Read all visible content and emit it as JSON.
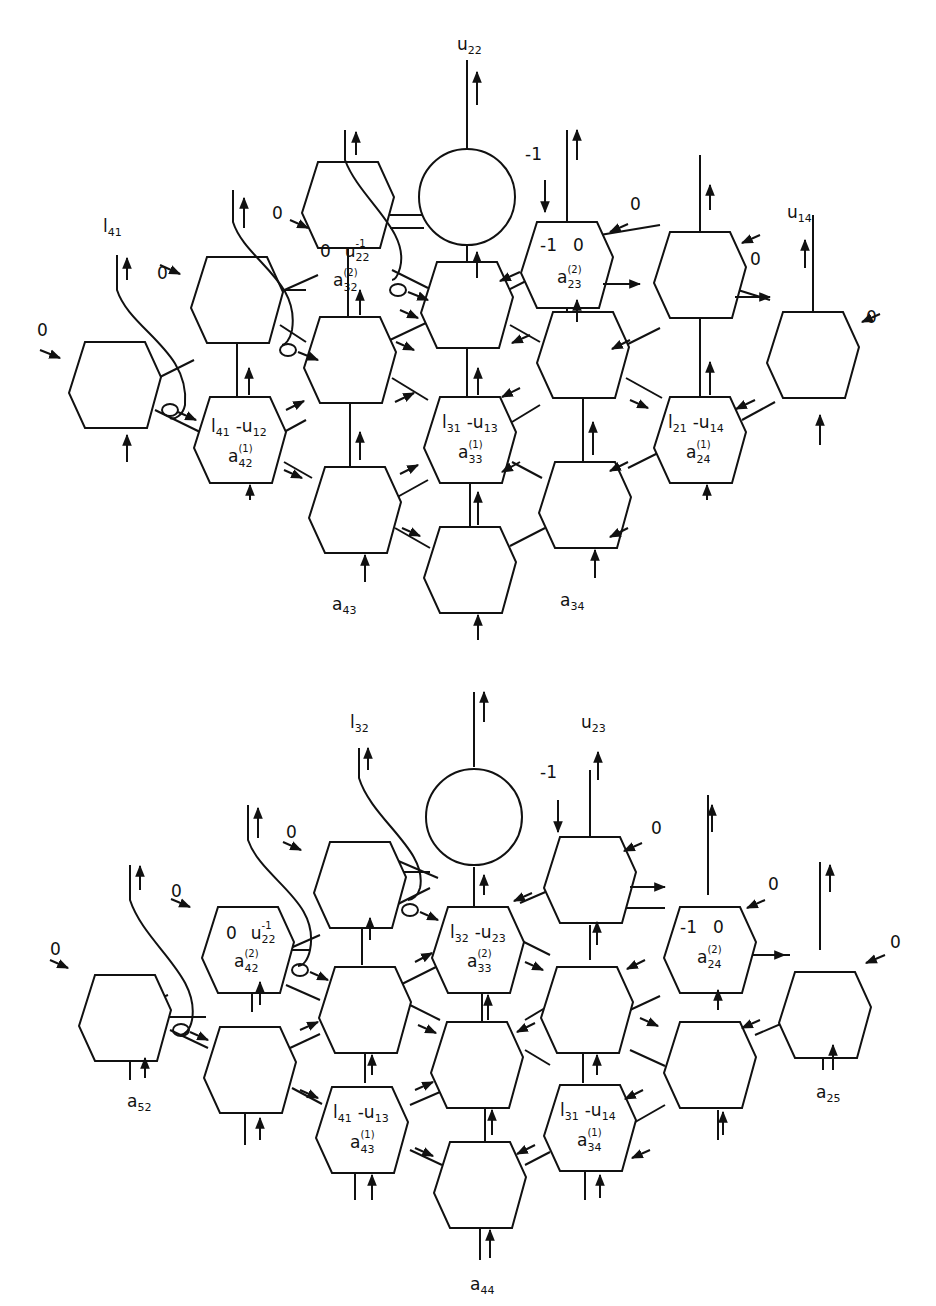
{
  "figure": {
    "type": "systolic hexagonal array diagram",
    "panels": [
      {
        "id": "top",
        "top_labels": {
          "u22": {
            "base": "u",
            "sub": "22"
          },
          "l41": {
            "base": "l",
            "sub": "41"
          },
          "u14": {
            "base": "u",
            "sub": "14"
          },
          "minus_one": "-1"
        },
        "zero_inputs": [
          "0",
          "0",
          "0",
          "0",
          "0",
          "0"
        ],
        "cells": [
          {
            "id": "a32_2",
            "line1": [
              "0",
              "u",
              "22",
              "-1"
            ],
            "line2": [
              "a",
              "32",
              "(2)"
            ]
          },
          {
            "id": "a23_2",
            "line1": [
              "-1",
              "0"
            ],
            "line2": [
              "a",
              "23",
              "(2)"
            ]
          },
          {
            "id": "a42_1",
            "line1": [
              "l",
              "41",
              "-u",
              "12"
            ],
            "line2": [
              "a",
              "42",
              "(1)"
            ]
          },
          {
            "id": "a33_1",
            "line1": [
              "l",
              "31",
              "-u",
              "13"
            ],
            "line2": [
              "a",
              "33",
              "(1)"
            ]
          },
          {
            "id": "a24_1",
            "line1": [
              "l",
              "21",
              "-u",
              "14"
            ],
            "line2": [
              "a",
              "24",
              "(1)"
            ]
          }
        ],
        "bottom_labels": {
          "a43": {
            "base": "a",
            "sub": "43"
          },
          "a34": {
            "base": "a",
            "sub": "34"
          }
        }
      },
      {
        "id": "bottom",
        "top_labels": {
          "l32": {
            "base": "l",
            "sub": "32"
          },
          "u23": {
            "base": "u",
            "sub": "23"
          },
          "minus_one": "-1"
        },
        "zero_inputs": [
          "0",
          "0",
          "0",
          "0",
          "0",
          "0"
        ],
        "cells": [
          {
            "id": "a42_2",
            "line1": [
              "0",
              "u",
              "22",
              "-1"
            ],
            "line2": [
              "a",
              "42",
              "(2)"
            ]
          },
          {
            "id": "a33_2",
            "line1": [
              "l",
              "32",
              "-u",
              "23"
            ],
            "line2": [
              "a",
              "33",
              "(2)"
            ]
          },
          {
            "id": "a24_2",
            "line1": [
              "-1",
              "0"
            ],
            "line2": [
              "a",
              "24",
              "(2)"
            ]
          },
          {
            "id": "a43_1",
            "line1": [
              "l",
              "41",
              "-u",
              "13"
            ],
            "line2": [
              "a",
              "43",
              "(1)"
            ]
          },
          {
            "id": "a34_1",
            "line1": [
              "l",
              "31",
              "-u",
              "14"
            ],
            "line2": [
              "a",
              "34",
              "(1)"
            ]
          }
        ],
        "bottom_labels": {
          "a52": {
            "base": "a",
            "sub": "52"
          },
          "a25": {
            "base": "a",
            "sub": "25"
          },
          "a44": {
            "base": "a",
            "sub": "44"
          }
        }
      }
    ]
  },
  "text": {
    "zero": "0",
    "minus_one": "-1",
    "neg_u": "-u",
    "u": "u",
    "l": "l",
    "a": "a",
    "sup1": "(1)",
    "sup2": "(2)",
    "inv": "-1",
    "s22": "22",
    "s23": "23",
    "s32": "32",
    "s41": "41",
    "s14": "14",
    "s12": "12",
    "s13": "13",
    "s31": "31",
    "s21": "21",
    "s42": "42",
    "s33": "33",
    "s24": "24",
    "s43": "43",
    "s34": "34",
    "s52": "52",
    "s25": "25",
    "s44": "44"
  }
}
